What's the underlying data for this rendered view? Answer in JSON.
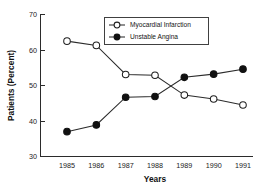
{
  "chart_data": {
    "type": "line",
    "title": "",
    "xlabel": "Years",
    "ylabel": "Patients (Percent)",
    "categories": [
      "1985",
      "1986",
      "1987",
      "1988",
      "1989",
      "1990",
      "1991"
    ],
    "xlim": [
      1984.5,
      1991.5
    ],
    "ylim": [
      30,
      70
    ],
    "yticks": [
      30,
      40,
      50,
      60,
      70
    ],
    "grid": false,
    "legend_position": "top-center",
    "series": [
      {
        "name": "Myocardial Infarction",
        "marker": "open-circle",
        "values": [
          62.5,
          61.3,
          53.1,
          52.9,
          47.3,
          46.2,
          44.5
        ]
      },
      {
        "name": "Unstable Angina",
        "marker": "filled-circle",
        "values": [
          37.0,
          38.9,
          46.7,
          46.9,
          52.3,
          53.2,
          54.6
        ]
      }
    ]
  },
  "axes": {
    "y_title": "Patients (Percent)",
    "x_title": "Years",
    "y_tick_labels": [
      "30",
      "40",
      "50",
      "60",
      "70"
    ],
    "x_tick_labels": [
      "1985",
      "1986",
      "1987",
      "1988",
      "1989",
      "1990",
      "1991"
    ]
  },
  "legend": {
    "entries": [
      {
        "label": "Myocardial Infarction",
        "marker": "open-circle"
      },
      {
        "label": "Unstable Angina",
        "marker": "filled-circle"
      }
    ]
  },
  "colors": {
    "line": "#2b2b2b",
    "marker_fill_open": "#ffffff",
    "marker_fill_closed": "#111111",
    "text": "#111111",
    "background": "#ffffff"
  }
}
